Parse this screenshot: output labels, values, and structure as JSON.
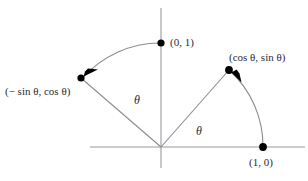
{
  "figure": {
    "colors": {
      "axis": "#9a9aa0",
      "ray": "#8c8c92",
      "arc": "#8c8c92",
      "point": "#000000",
      "arrow": "#000000",
      "text": "#2b2b33",
      "background": "#ffffff"
    },
    "axes": {
      "x_axis_label": "x-axis",
      "y_axis_label": "y-axis",
      "origin_label": "origin"
    },
    "points": [
      {
        "id": "p-01",
        "label": "(0, 1)",
        "x": 161,
        "y": 43
      },
      {
        "id": "p-10",
        "label": "(1, 0)",
        "x": 263,
        "y": 147
      },
      {
        "id": "p-cs",
        "label": "(cos θ, sin θ)",
        "x": 229,
        "y": 70
      },
      {
        "id": "p-nsc",
        "label": "(− sin θ, cos θ)",
        "x": 81,
        "y": 78
      }
    ],
    "angles": [
      {
        "id": "theta-left",
        "label": "θ"
      },
      {
        "id": "theta-right",
        "label": "θ"
      }
    ],
    "arcs": [
      {
        "id": "arc-right",
        "from": "(1, 0)",
        "to": "(cos θ, sin θ)",
        "direction": "counterclockwise"
      },
      {
        "id": "arc-left",
        "from": "(0, 1)",
        "to": "(− sin θ, cos θ)",
        "direction": "counterclockwise"
      }
    ]
  }
}
